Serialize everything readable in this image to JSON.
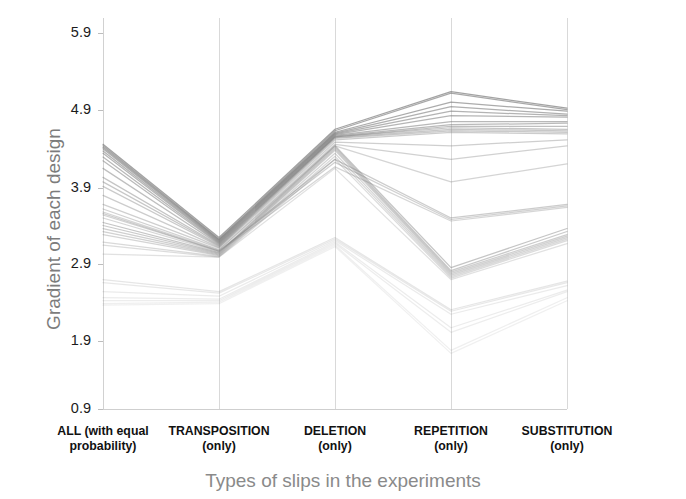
{
  "chart_data": {
    "type": "line",
    "subtype": "parallel-coordinates",
    "title": "",
    "xlabel": "Types of slips in the experiments",
    "ylabel": "Gradient of each design",
    "categories": [
      "ALL (with equal probability)",
      "TRANSPOSITION (only)",
      "DELETION (only)",
      "REPETITION (only)",
      "SUBSTITUTION (only)"
    ],
    "category_lines": [
      [
        "ALL (with equal",
        "probability)"
      ],
      [
        "TRANSPOSITION",
        "(only)"
      ],
      [
        "DELETION",
        "(only)"
      ],
      [
        "REPETITION",
        "(only)"
      ],
      [
        "SUBSTITUTION",
        "(only)"
      ]
    ],
    "yticks": [
      0.9,
      1.9,
      2.9,
      3.9,
      4.9,
      5.9
    ],
    "ytick_labels": [
      "0.9",
      "1.9",
      "2.9",
      "3.9",
      "4.9",
      "5.9"
    ],
    "ylim": [
      0.9,
      6.25
    ],
    "grid": false,
    "axis_color": "#cfcfcf",
    "line_color": "#808080",
    "legend": "none",
    "series": [
      {
        "name": "d01",
        "values": [
          4.42,
          3.18,
          4.62,
          5.12,
          4.9
        ],
        "opacity": 0.72
      },
      {
        "name": "d02",
        "values": [
          4.4,
          3.16,
          4.6,
          5.1,
          4.88
        ],
        "opacity": 0.68
      },
      {
        "name": "d03",
        "values": [
          4.38,
          3.15,
          4.58,
          4.98,
          4.86
        ],
        "opacity": 0.66
      },
      {
        "name": "d04",
        "values": [
          4.36,
          3.14,
          4.57,
          4.92,
          4.82
        ],
        "opacity": 0.62
      },
      {
        "name": "d05",
        "values": [
          4.33,
          3.13,
          4.56,
          4.86,
          4.8
        ],
        "opacity": 0.6
      },
      {
        "name": "d06",
        "values": [
          4.3,
          3.12,
          4.55,
          4.8,
          4.78
        ],
        "opacity": 0.58
      },
      {
        "name": "d07",
        "values": [
          4.25,
          3.11,
          4.54,
          4.72,
          4.72
        ],
        "opacity": 0.56
      },
      {
        "name": "d08",
        "values": [
          4.2,
          3.1,
          4.53,
          4.68,
          4.7
        ],
        "opacity": 0.54
      },
      {
        "name": "d09",
        "values": [
          4.1,
          3.09,
          4.52,
          4.66,
          4.66
        ],
        "opacity": 0.5
      },
      {
        "name": "d10",
        "values": [
          3.98,
          3.08,
          4.52,
          4.64,
          4.62
        ],
        "opacity": 0.46
      },
      {
        "name": "d11",
        "values": [
          3.92,
          3.07,
          4.51,
          4.62,
          4.6
        ],
        "opacity": 0.44
      },
      {
        "name": "d12",
        "values": [
          3.86,
          3.06,
          4.5,
          4.6,
          4.58
        ],
        "opacity": 0.42
      },
      {
        "name": "d13",
        "values": [
          3.74,
          3.05,
          4.48,
          4.58,
          4.56
        ],
        "opacity": 0.4
      },
      {
        "name": "d14",
        "values": [
          3.62,
          3.04,
          4.45,
          4.4,
          4.48
        ],
        "opacity": 0.38
      },
      {
        "name": "d15",
        "values": [
          3.56,
          3.02,
          4.42,
          4.22,
          4.4
        ],
        "opacity": 0.36
      },
      {
        "name": "d16",
        "values": [
          3.52,
          3.01,
          4.4,
          3.92,
          4.16
        ],
        "opacity": 0.34
      },
      {
        "name": "d17",
        "values": [
          3.5,
          3.0,
          4.22,
          3.44,
          3.62
        ],
        "opacity": 0.4
      },
      {
        "name": "d18",
        "values": [
          3.48,
          3.0,
          4.18,
          3.42,
          3.6
        ],
        "opacity": 0.36
      },
      {
        "name": "d19",
        "values": [
          3.44,
          2.99,
          4.12,
          3.4,
          3.58
        ],
        "opacity": 0.32
      },
      {
        "name": "d20",
        "values": [
          3.38,
          2.98,
          4.4,
          2.78,
          3.3
        ],
        "opacity": 0.46
      },
      {
        "name": "d21",
        "values": [
          3.34,
          2.97,
          4.38,
          2.74,
          3.26
        ],
        "opacity": 0.42
      },
      {
        "name": "d22",
        "values": [
          3.3,
          2.96,
          4.36,
          2.72,
          3.22
        ],
        "opacity": 0.38
      },
      {
        "name": "d23",
        "values": [
          3.26,
          2.95,
          4.34,
          2.7,
          3.2
        ],
        "opacity": 0.36
      },
      {
        "name": "d24",
        "values": [
          3.22,
          2.94,
          4.3,
          2.68,
          3.18
        ],
        "opacity": 0.34
      },
      {
        "name": "d25",
        "values": [
          3.12,
          2.93,
          4.26,
          2.66,
          3.16
        ],
        "opacity": 0.3
      },
      {
        "name": "d26",
        "values": [
          3.08,
          2.92,
          4.22,
          2.64,
          3.14
        ],
        "opacity": 0.28
      },
      {
        "name": "d27",
        "values": [
          2.96,
          2.92,
          4.1,
          2.62,
          3.1
        ],
        "opacity": 0.24
      },
      {
        "name": "d28",
        "values": [
          2.62,
          2.46,
          3.18,
          2.22,
          2.6
        ],
        "opacity": 0.2
      },
      {
        "name": "d29",
        "values": [
          2.58,
          2.44,
          3.16,
          2.2,
          2.58
        ],
        "opacity": 0.18
      },
      {
        "name": "d30",
        "values": [
          2.46,
          2.4,
          3.14,
          2.16,
          2.54
        ],
        "opacity": 0.16
      },
      {
        "name": "d31",
        "values": [
          2.38,
          2.36,
          3.12,
          1.98,
          2.48
        ],
        "opacity": 0.15
      },
      {
        "name": "d32",
        "values": [
          2.34,
          2.34,
          3.1,
          1.92,
          2.46
        ],
        "opacity": 0.14
      },
      {
        "name": "d33",
        "values": [
          2.3,
          2.32,
          3.08,
          1.68,
          2.38
        ],
        "opacity": 0.13
      },
      {
        "name": "d34",
        "values": [
          2.28,
          2.3,
          3.06,
          1.64,
          2.34
        ],
        "opacity": 0.12
      }
    ]
  },
  "plot_geometry": {
    "left": 103,
    "right": 567,
    "top": 18,
    "bottom": 409,
    "tick_y": {
      "0.9": 409,
      "1.9": 341,
      "2.9": 264,
      "3.9": 188,
      "4.9": 110,
      "5.9": 33
    },
    "axis_x": [
      103,
      219,
      335,
      451,
      567
    ]
  }
}
